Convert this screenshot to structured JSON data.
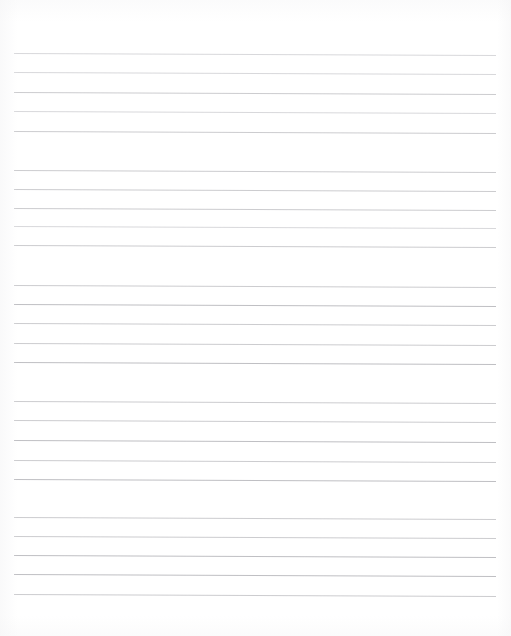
{
  "page": {
    "kind": "blank-ruled-notebook-page",
    "width": 511,
    "height": 636,
    "background_color": "#ffffff",
    "has_text": false,
    "text_content": "",
    "margins": {
      "top": 53,
      "bottom": 42,
      "left": 14,
      "right": 15
    }
  },
  "ruling": {
    "line_color": "#c9c9cc",
    "line_color_strong": "#bcbcc0",
    "line_color_faint": "#d6d6d9",
    "line_thickness": 1,
    "line_start_x": 14,
    "line_end_x": 496,
    "line_length": 482,
    "skew_degrees": -0.24,
    "line_spacing": 19.4,
    "group_gap": 39,
    "lines_per_group": 5,
    "group_count": 5,
    "total_lines": 25
  },
  "lines": [
    {
      "index": 1,
      "group": 1,
      "y": 53,
      "weight": "faint"
    },
    {
      "index": 2,
      "group": 1,
      "y": 72,
      "weight": "faint"
    },
    {
      "index": 3,
      "group": 1,
      "y": 92,
      "weight": "normal"
    },
    {
      "index": 4,
      "group": 1,
      "y": 111,
      "weight": "faint"
    },
    {
      "index": 5,
      "group": 1,
      "y": 131,
      "weight": "normal"
    },
    {
      "index": 6,
      "group": 2,
      "y": 170,
      "weight": "normal"
    },
    {
      "index": 7,
      "group": 2,
      "y": 189,
      "weight": "normal"
    },
    {
      "index": 8,
      "group": 2,
      "y": 208,
      "weight": "normal"
    },
    {
      "index": 9,
      "group": 2,
      "y": 226,
      "weight": "faint"
    },
    {
      "index": 10,
      "group": 2,
      "y": 245,
      "weight": "normal"
    },
    {
      "index": 11,
      "group": 3,
      "y": 285,
      "weight": "normal"
    },
    {
      "index": 12,
      "group": 3,
      "y": 304,
      "weight": "strong"
    },
    {
      "index": 13,
      "group": 3,
      "y": 323,
      "weight": "normal"
    },
    {
      "index": 14,
      "group": 3,
      "y": 343,
      "weight": "normal"
    },
    {
      "index": 15,
      "group": 3,
      "y": 362,
      "weight": "strong"
    },
    {
      "index": 16,
      "group": 4,
      "y": 401,
      "weight": "normal"
    },
    {
      "index": 17,
      "group": 4,
      "y": 420,
      "weight": "normal"
    },
    {
      "index": 18,
      "group": 4,
      "y": 440,
      "weight": "strong"
    },
    {
      "index": 19,
      "group": 4,
      "y": 460,
      "weight": "normal"
    },
    {
      "index": 20,
      "group": 4,
      "y": 479,
      "weight": "strong"
    },
    {
      "index": 21,
      "group": 5,
      "y": 517,
      "weight": "normal"
    },
    {
      "index": 22,
      "group": 5,
      "y": 536,
      "weight": "normal"
    },
    {
      "index": 23,
      "group": 5,
      "y": 555,
      "weight": "strong"
    },
    {
      "index": 24,
      "group": 5,
      "y": 574,
      "weight": "strong"
    },
    {
      "index": 25,
      "group": 5,
      "y": 594,
      "weight": "normal"
    }
  ]
}
